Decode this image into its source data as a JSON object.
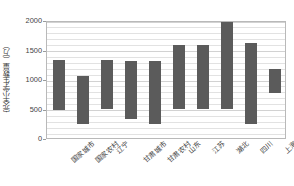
{
  "chart_data": {
    "type": "bar",
    "bar_style": "floating-range",
    "title": "",
    "xlabel": "",
    "ylabel": "完全小学生数量（万）",
    "ylim": [
      0,
      2000
    ],
    "yticks": [
      0,
      500,
      1000,
      1500,
      2000
    ],
    "ytick_labels": [
      "0",
      "500",
      "1000",
      "1500",
      "2000"
    ],
    "grid": true,
    "minor_grid_step": 100,
    "legend": "none",
    "categories": [
      "国家城市",
      "国家农村",
      "辽宁",
      "甘肃城市",
      "甘肃农村",
      "山东",
      "江苏",
      "湖北",
      "四川",
      "上海"
    ],
    "series": [
      {
        "name": "范围下限",
        "values": [
          500,
          270,
          530,
          350,
          270,
          530,
          530,
          530,
          270,
          800
        ]
      },
      {
        "name": "范围上限",
        "values": [
          1350,
          1080,
          1350,
          1340,
          1340,
          1610,
          1610,
          2000,
          1650,
          1200
        ]
      }
    ],
    "bar_color": "#5b5b5b",
    "plot_border_color": "#b9b9b9",
    "gridline_color": "#e2e2e2"
  }
}
